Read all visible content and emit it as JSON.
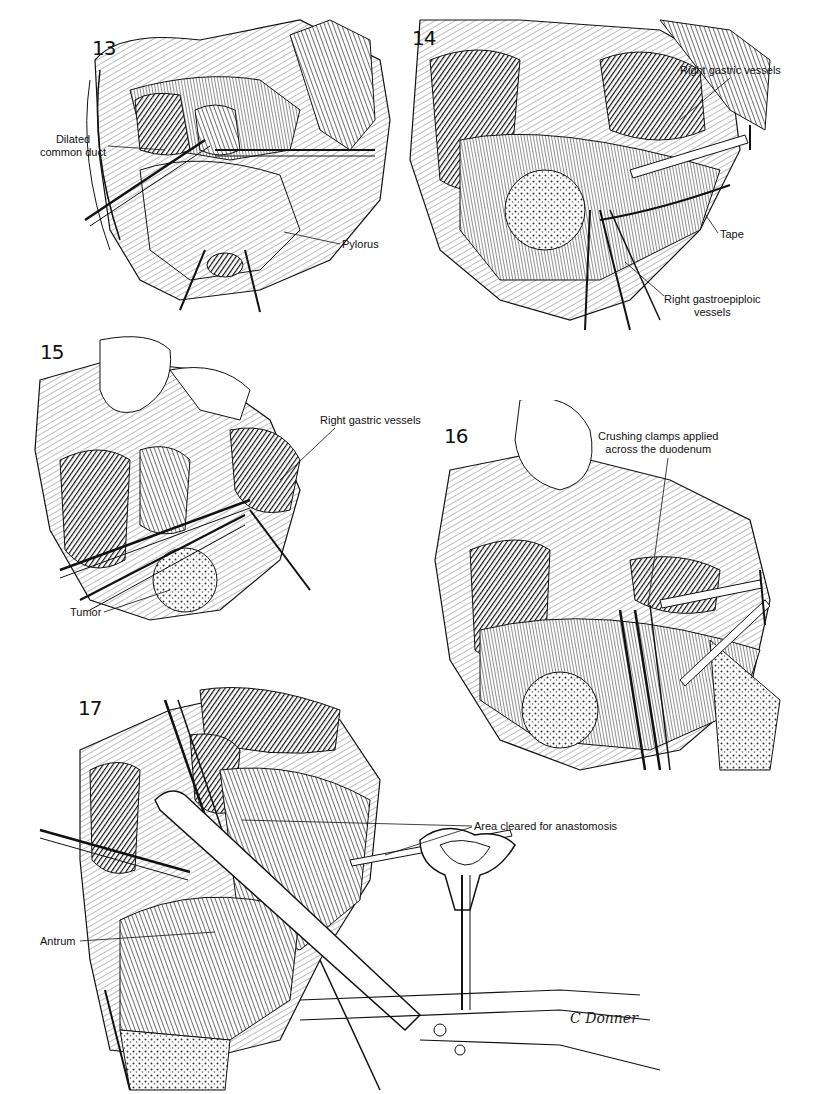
{
  "plate": {
    "signature": "C Donner",
    "figures": [
      {
        "number": "13",
        "labels": [
          {
            "text": "Dilated\ncommon duct",
            "line1": "Dilated",
            "line2": "common duct"
          },
          {
            "text": "Pylorus"
          }
        ]
      },
      {
        "number": "14",
        "labels": [
          {
            "text": "Right gastric vessels"
          },
          {
            "text": "Tape"
          },
          {
            "text": "Right gastroepiploic vessels",
            "line1": "Right gastroepiploic",
            "line2": "vessels"
          }
        ]
      },
      {
        "number": "15",
        "labels": [
          {
            "text": "Right gastric vessels"
          },
          {
            "text": "Tumor"
          }
        ]
      },
      {
        "number": "16",
        "labels": [
          {
            "text": "Crushing clamps applied across the duodenum",
            "line1": "Crushing clamps applied",
            "line2": "across the duodenum"
          }
        ]
      },
      {
        "number": "17",
        "labels": [
          {
            "text": "Area cleared for anastomosis"
          },
          {
            "text": "Antrum"
          }
        ]
      }
    ]
  },
  "colors": {
    "ink": "#111111",
    "tissue_dark": "#2a2a2a",
    "tissue_mid": "#7a7a7a",
    "tissue_light": "#d6d6d6",
    "paper": "#ffffff"
  }
}
